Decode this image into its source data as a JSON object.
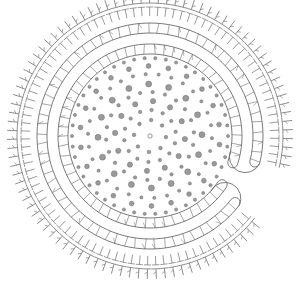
{
  "illustration": {
    "description": "Hand-drawn circular spiral/ring pattern: a C-shaped segmented band enclosing a field of dots, surrounded by a fringe of small tick marks",
    "width": 298,
    "height": 287,
    "center": [
      150,
      136
    ],
    "colors": {
      "background": "#ffffff",
      "line": "#6b6b6b",
      "dot_fill": "#9a9a9a",
      "dot_stroke": "#6e6e6e",
      "tick": "#808080"
    },
    "band": {
      "outer_radius_outer_edge": 113,
      "outer_radius_inner_edge": 103,
      "inner_radius_outer_edge": 92,
      "inner_radius_inner_edge": 82,
      "gap_start_deg": 14,
      "gap_end_deg": 38
    },
    "fringe": {
      "inner_radius": 120,
      "outer_radius": 143,
      "start_deg": 40,
      "end_deg": 372,
      "count": 92
    },
    "dots": {
      "rings": [
        {
          "r": 78,
          "count": 46,
          "size": 1.6
        },
        {
          "r": 70,
          "count": 22,
          "size": 2.4
        },
        {
          "r": 62,
          "count": 30,
          "size": 1.6
        },
        {
          "r": 52,
          "count": 16,
          "size": 3.0
        },
        {
          "r": 44,
          "count": 22,
          "size": 1.7
        },
        {
          "r": 35,
          "count": 12,
          "size": 2.6
        },
        {
          "r": 26,
          "count": 14,
          "size": 1.7
        },
        {
          "r": 16,
          "count": 8,
          "size": 1.8
        }
      ],
      "center_dot": {
        "size": 2.2,
        "hollow": true
      }
    }
  }
}
